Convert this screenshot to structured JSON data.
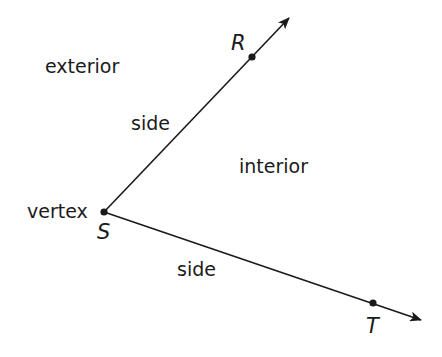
{
  "diagram": {
    "type": "angle",
    "labels": {
      "exterior": "exterior",
      "interior": "interior",
      "side_upper": "side",
      "side_lower": "side",
      "vertex": "vertex"
    },
    "points": {
      "R": "R",
      "S": "S",
      "T": "T"
    },
    "colors": {
      "stroke": "#1a1a1a",
      "background": "#ffffff"
    },
    "rays": [
      {
        "name": "ray SR",
        "from": "S",
        "through": "R"
      },
      {
        "name": "ray ST",
        "from": "S",
        "through": "T"
      }
    ]
  }
}
